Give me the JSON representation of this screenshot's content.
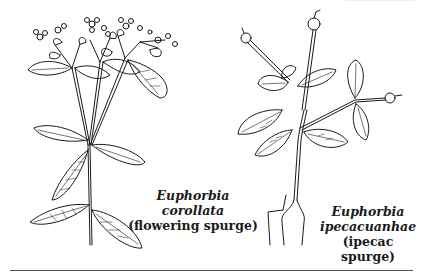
{
  "figure": {
    "plants": [
      {
        "id": "plant-1",
        "scientific_name": "Euphorbia corollata",
        "common_name": "(flowering spurge)"
      },
      {
        "id": "plant-2",
        "scientific_name_line1": "Euphorbia",
        "scientific_name_line2": "ipecacuanhae",
        "common_name": "(ipecac spurge)"
      }
    ],
    "colors": {
      "ink": "#1a1a1a",
      "background": "#ffffff",
      "rule": "#555555"
    }
  }
}
